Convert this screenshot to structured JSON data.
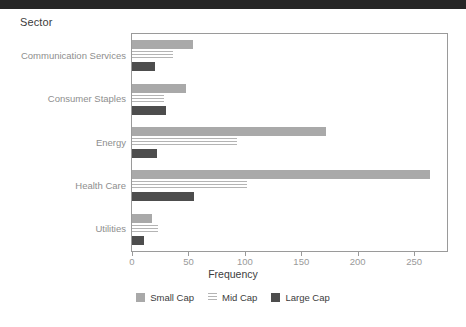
{
  "topbar": {
    "present": true
  },
  "chart_title": "Sector",
  "chart_data": {
    "type": "bar",
    "orientation": "horizontal",
    "title": "Sector",
    "xlabel": "Frequency",
    "ylabel": "Sector",
    "grid": false,
    "legend_position": "bottom",
    "xlim": [
      0,
      280
    ],
    "xticks": [
      0,
      50,
      100,
      150,
      200,
      250
    ],
    "categories": [
      "Communication Services",
      "Consumer Staples",
      "Energy",
      "Health Care",
      "Utilities"
    ],
    "series": [
      {
        "name": "Small Cap",
        "color": "#a9a9a9",
        "values": [
          54,
          48,
          172,
          264,
          18
        ]
      },
      {
        "name": "Mid Cap",
        "color": "#b4b4b4",
        "values": [
          36,
          28,
          93,
          102,
          23
        ]
      },
      {
        "name": "Large Cap",
        "color": "#4d4d4d",
        "values": [
          20,
          30,
          22,
          55,
          11
        ]
      }
    ]
  },
  "legend": {
    "items": [
      {
        "label": "Small Cap",
        "style": "small"
      },
      {
        "label": "Mid Cap",
        "style": "mid"
      },
      {
        "label": "Large Cap",
        "style": "large"
      }
    ]
  },
  "axis": {
    "x_label": "Frequency",
    "x_tick_labels": [
      "0",
      "50",
      "100",
      "150",
      "200",
      "250"
    ]
  },
  "colors": {
    "small_cap": "#a9a9a9",
    "mid_cap": "#b4b4b4",
    "large_cap": "#4d4d4d",
    "frame": "#9a9a9a",
    "tick_text": "#9a9a9a",
    "category_text": "#8e8e8e",
    "title_text": "#3c3c3c",
    "topbar": "#262626"
  }
}
